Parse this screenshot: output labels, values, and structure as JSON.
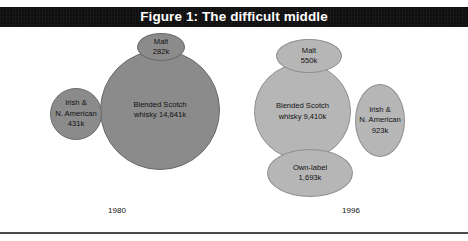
{
  "figure": {
    "title": "Figure 1: The difficult middle",
    "title_band_color": "#0d0d0d",
    "title_text_color": "#ffffff",
    "background_color": "#ffffff"
  },
  "colors": {
    "bubble_1980_fill": "#8b8b8b",
    "bubble_1996_fill": "#b6b6b6",
    "bubble_stroke": "#6f6f6f",
    "label_text": "#111111",
    "rule": "#4a4a4a"
  },
  "groups": {
    "y1980": {
      "year_label": "1980",
      "bubbles": {
        "malt": {
          "name": "Malt",
          "value_label": "282k"
        },
        "blended": {
          "name_line1": "Blended Scotch",
          "name_line2": "whisky 14,641k"
        },
        "irish": {
          "name_line1": "Irish &",
          "name_line2": "N. American",
          "value_label": "431k"
        }
      }
    },
    "y1996": {
      "year_label": "1996",
      "bubbles": {
        "malt": {
          "name": "Malt",
          "value_label": "550k"
        },
        "blended": {
          "name_line1": "Blended Scotch",
          "name_line2": "whisky 9,410k"
        },
        "irish": {
          "name_line1": "Irish &",
          "name_line2": "N. American",
          "value_label": "923k"
        },
        "ownlabel": {
          "name": "Own-label",
          "value_label": "1,693k"
        }
      }
    }
  },
  "chart_data": {
    "type": "bubble",
    "title": "Figure 1: The difficult middle",
    "xlabel": "",
    "ylabel": "",
    "unit": "k (thousands of cases)",
    "grid": false,
    "legend": "none",
    "groups": [
      "1980",
      "1996"
    ],
    "series": [
      {
        "name": "1980",
        "fill": "#8b8b8b",
        "points": [
          {
            "label": "Malt",
            "value": 282,
            "value_label": "282k"
          },
          {
            "label": "Blended Scotch whisky",
            "value": 14641,
            "value_label": "14,641k"
          },
          {
            "label": "Irish & N. American",
            "value": 431,
            "value_label": "431k"
          }
        ]
      },
      {
        "name": "1996",
        "fill": "#b6b6b6",
        "points": [
          {
            "label": "Malt",
            "value": 550,
            "value_label": "550k"
          },
          {
            "label": "Blended Scotch whisky",
            "value": 9410,
            "value_label": "9,410k"
          },
          {
            "label": "Irish & N. American",
            "value": 923,
            "value_label": "923k"
          },
          {
            "label": "Own-label",
            "value": 1693,
            "value_label": "1,693k"
          }
        ]
      }
    ]
  }
}
